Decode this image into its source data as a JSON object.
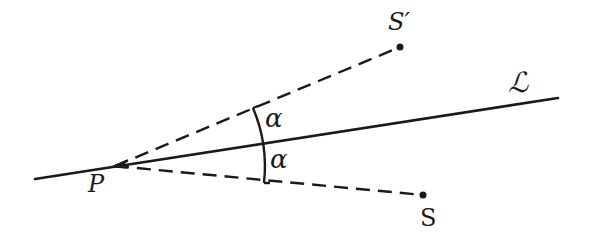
{
  "diagram": {
    "type": "geometric-reflection",
    "colors": {
      "ink": "#1a1a1a",
      "background": "#ffffff"
    },
    "points": {
      "P": {
        "label": "P",
        "x": 115,
        "y": 166
      },
      "S": {
        "label": "S",
        "x": 423,
        "y": 195
      },
      "S_prime": {
        "label": "S′",
        "x": 400,
        "y": 47
      }
    },
    "line_L": {
      "label": "ℒ",
      "x1": 35,
      "y1": 179,
      "x2": 558,
      "y2": 98
    },
    "angles": [
      {
        "label": "α",
        "between": "S′P and ℒ"
      },
      {
        "label": "α",
        "between": "ℒ and SP"
      }
    ]
  }
}
